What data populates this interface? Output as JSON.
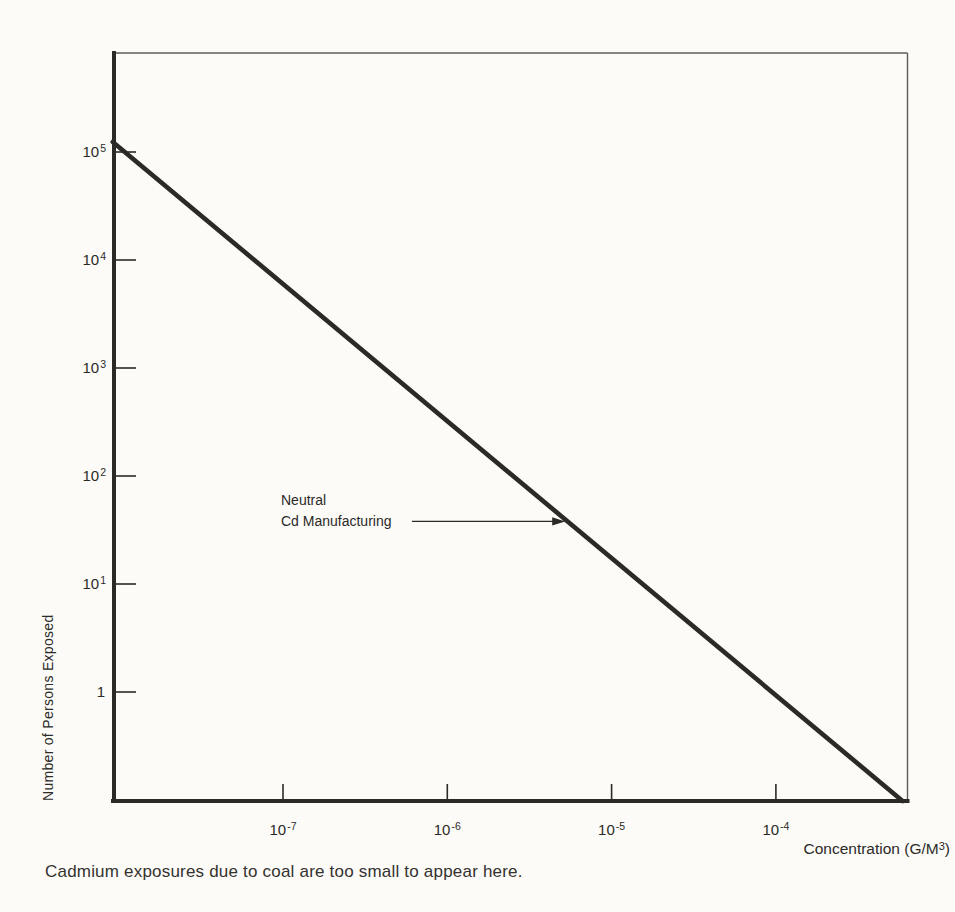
{
  "page": {
    "background": "#fcfbf8",
    "ink": "#2b2a27",
    "border_gray": "#5f5c58"
  },
  "chart_data": {
    "type": "line",
    "xscale": "log",
    "yscale": "log",
    "grid": false,
    "xlabel": {
      "prefix": "Concentration (G/M",
      "sup": "3",
      "suffix": ")"
    },
    "ylabel": "Number of Persons Exposed",
    "xlim": [
      9.2e-09,
      0.00062
    ],
    "ylim": [
      0.097,
      840000
    ],
    "xticks": [
      {
        "value": 1e-07,
        "base": "10",
        "exp": "-7"
      },
      {
        "value": 1e-06,
        "base": "10",
        "exp": "-6"
      },
      {
        "value": 1e-05,
        "base": "10",
        "exp": "-5"
      },
      {
        "value": 0.0001,
        "base": "10",
        "exp": "-4"
      }
    ],
    "yticks": [
      {
        "value": 100000.0,
        "base": "10",
        "exp": "5"
      },
      {
        "value": 10000.0,
        "base": "10",
        "exp": "4"
      },
      {
        "value": 1000.0,
        "base": "10",
        "exp": "3"
      },
      {
        "value": 100.0,
        "base": "10",
        "exp": "2"
      },
      {
        "value": 10.0,
        "base": "10",
        "exp": "1"
      },
      {
        "value": 1,
        "base": "1",
        "exp": ""
      }
    ],
    "series": [
      {
        "name": "Neutral Cd Manufacturing",
        "points": [
          [
            9.2e-09,
            124000
          ],
          [
            0.00059,
            0.098
          ]
        ]
      }
    ],
    "annotation": {
      "line1": "Neutral",
      "line2": "Cd Manufacturing",
      "arrow_from": [
        6.1e-07,
        38
      ],
      "arrow_to": [
        4.6e-06,
        38
      ]
    },
    "caption": "Cadmium exposures due to coal are too small to appear here."
  }
}
